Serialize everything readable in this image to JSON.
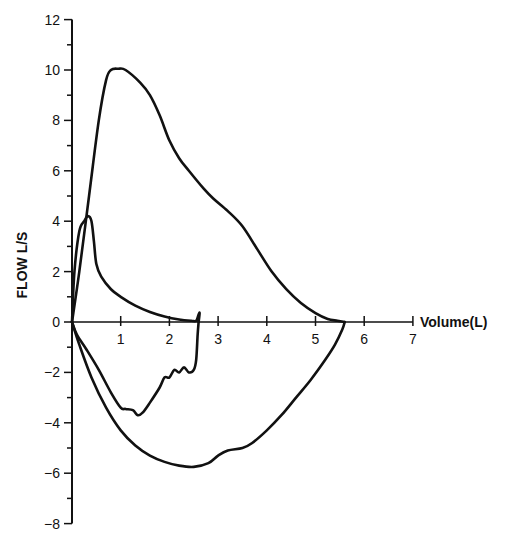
{
  "chart_data": {
    "type": "line",
    "title": "",
    "xlabel": "Volume(L)",
    "ylabel": "FLOW L/S",
    "xlim": [
      0,
      7
    ],
    "ylim": [
      -8,
      12
    ],
    "x_ticks": [
      1,
      2,
      3,
      4,
      5,
      6,
      7
    ],
    "y_ticks": [
      12,
      10,
      8,
      6,
      4,
      2,
      0,
      -2,
      -4,
      -6,
      -8
    ],
    "grid": false,
    "legend": null,
    "series": [
      {
        "name": "outer loop (expiratory)",
        "x": [
          0,
          0.15,
          0.35,
          0.55,
          0.7,
          0.8,
          0.95,
          1.1,
          1.4,
          1.6,
          1.8,
          2.0,
          2.2,
          2.4,
          2.7,
          2.9,
          3.2,
          3.5,
          3.8,
          4.1,
          4.4,
          4.7,
          5.0,
          5.25,
          5.45,
          5.6
        ],
        "y": [
          0,
          2.0,
          5.0,
          8.0,
          9.6,
          10.0,
          10.05,
          10.0,
          9.5,
          9.0,
          8.2,
          7.2,
          6.5,
          6.0,
          5.3,
          4.9,
          4.4,
          3.8,
          2.9,
          2.0,
          1.3,
          0.75,
          0.35,
          0.12,
          0.05,
          0
        ]
      },
      {
        "name": "outer loop (inspiratory)",
        "x": [
          5.6,
          5.55,
          5.4,
          5.2,
          4.9,
          4.6,
          4.3,
          4.0,
          3.7,
          3.5,
          3.2,
          3.0,
          2.8,
          2.5,
          2.2,
          1.9,
          1.6,
          1.3,
          1.0,
          0.7,
          0.4,
          0.15,
          0
        ],
        "y": [
          0,
          -0.3,
          -0.9,
          -1.5,
          -2.3,
          -3.0,
          -3.7,
          -4.3,
          -4.8,
          -5.0,
          -5.1,
          -5.3,
          -5.6,
          -5.75,
          -5.7,
          -5.55,
          -5.3,
          -4.9,
          -4.3,
          -3.4,
          -2.2,
          -0.9,
          0
        ]
      },
      {
        "name": "inner loop (expiratory)",
        "x": [
          0,
          0.05,
          0.15,
          0.25,
          0.33,
          0.4,
          0.45,
          0.5,
          0.6,
          0.8,
          1.0,
          1.3,
          1.6,
          1.9,
          2.2,
          2.45,
          2.55,
          2.6,
          2.62,
          2.6
        ],
        "y": [
          0,
          2.0,
          3.6,
          4.0,
          4.2,
          4.0,
          3.2,
          2.3,
          1.8,
          1.3,
          1.0,
          0.65,
          0.4,
          0.22,
          0.1,
          0.05,
          0.05,
          0.3,
          0.35,
          0
        ]
      },
      {
        "name": "inner loop (inspiratory)",
        "x": [
          2.6,
          2.58,
          2.55,
          2.5,
          2.4,
          2.3,
          2.2,
          2.1,
          2.0,
          1.9,
          1.8,
          1.6,
          1.45,
          1.35,
          1.25,
          1.1,
          1.0,
          0.8,
          0.55,
          0.3,
          0.1,
          0
        ],
        "y": [
          0,
          -0.5,
          -1.5,
          -1.9,
          -2.0,
          -1.8,
          -2.0,
          -1.9,
          -2.2,
          -2.2,
          -2.6,
          -3.2,
          -3.6,
          -3.7,
          -3.5,
          -3.45,
          -3.4,
          -2.8,
          -1.9,
          -1.1,
          -0.5,
          0
        ]
      }
    ]
  }
}
